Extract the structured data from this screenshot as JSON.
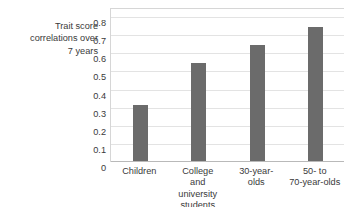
{
  "chart_data": {
    "type": "bar",
    "title": "",
    "xlabel": "",
    "ylabel": "Trait score correlations over 7 years",
    "ylabel_lines": [
      "Trait score",
      "correlations over",
      "7 years"
    ],
    "categories": [
      "Children",
      "College and university students",
      "30-year-olds",
      "50- to 70-year-olds"
    ],
    "category_lines": [
      [
        "Children"
      ],
      [
        "College",
        "and",
        "university",
        "students"
      ],
      [
        "30-year-",
        "olds"
      ],
      [
        "50-  to",
        "70-year-olds"
      ]
    ],
    "values": [
      0.31,
      0.54,
      0.64,
      0.74
    ],
    "ylim": [
      0,
      0.8
    ],
    "ytick_labels": [
      "0.8",
      "0.7",
      "0.6",
      "0.5",
      "0.4",
      "0.3",
      "0.2",
      "0.1",
      "0"
    ],
    "ytick_values": [
      0.8,
      0.7,
      0.6,
      0.5,
      0.4,
      0.3,
      0.2,
      0.1,
      0
    ],
    "grid": true,
    "legend": false,
    "bar_color": "#6b6b6b",
    "gridline_color": "#e3e3e3",
    "axis_color": "#b9b9b9",
    "text_color": "#3a3a3a",
    "background_color": "#ffffff"
  },
  "artifacts": {
    "top_clipped_text": " "
  }
}
